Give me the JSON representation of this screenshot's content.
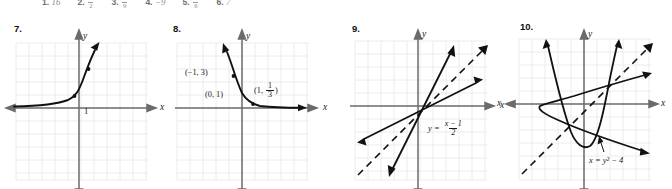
{
  "answer_row": {
    "items": [
      {
        "number": "1.",
        "value": "16",
        "type": "plain"
      },
      {
        "number": "2.",
        "numerator": "1",
        "denominator": "2",
        "type": "fraction"
      },
      {
        "number": "3.",
        "numerator": "1",
        "denominator": "9",
        "type": "fraction"
      },
      {
        "number": "4.",
        "value": "−9",
        "type": "plain"
      },
      {
        "number": "5.",
        "numerator": "1",
        "denominator": "6",
        "type": "fraction"
      },
      {
        "number": "6.",
        "value": "7",
        "type": "plain"
      }
    ]
  },
  "graphs": [
    {
      "number": "7.",
      "x_axis_label": "x",
      "y_axis_label": "y",
      "tick_label": "1",
      "curve_description": "increasing exponential curve through (0,1)",
      "points": [
        {
          "label": "",
          "x": 0,
          "y": 1
        },
        {
          "label": "",
          "x": 1,
          "y": 3
        }
      ]
    },
    {
      "number": "8.",
      "x_axis_label": "x",
      "y_axis_label": "y",
      "curve_description": "decreasing exponential curve y = 3^(-x)",
      "point_labels": [
        {
          "text": "(−1, 3)"
        },
        {
          "text": "(0, 1)"
        },
        {
          "text_prefix": "(1, ",
          "numerator": "1",
          "denominator": "3",
          "text_suffix": ")"
        }
      ]
    },
    {
      "number": "9.",
      "x_axis_label": "x",
      "y_axis_label": "y",
      "equation_prefix": "y = ",
      "equation_numerator": "x − 1",
      "equation_denominator": "2",
      "curve_description": "two solid lines reflected across dashed line y = x",
      "dashed_line": "y = x"
    },
    {
      "number": "10.",
      "x_axis_label_left": "x",
      "x_axis_label_right": "x",
      "y_axis_label": "y",
      "equation": "x = y² − 4",
      "curve_description": "upward parabola and rightward parabola reflected across dashed line y = x",
      "dashed_line": "y = x"
    }
  ],
  "colors": {
    "grid": "#e9e6ea",
    "axis": "#6b6b6b",
    "curve": "#111111",
    "text": "#1a1a1a"
  }
}
